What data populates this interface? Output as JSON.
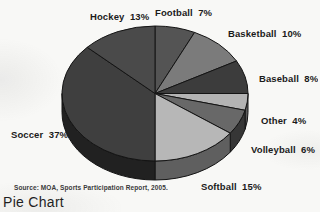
{
  "caption": "Pie Chart",
  "source_note": "Source: MOA, Sports Participation Report, 2005.",
  "chart_data": {
    "type": "pie",
    "style": "3d",
    "title": "Pie Chart",
    "unit": "%",
    "start_angle_deg": 0,
    "direction": "clockwise",
    "source": "MOA, Sports Participation Report, 2005",
    "slices": [
      {
        "label": "Football",
        "value": 7,
        "color": "#545454",
        "label_x": 155,
        "label_y": 7
      },
      {
        "label": "Basketball",
        "value": 10,
        "color": "#7b7b7b",
        "label_x": 228,
        "label_y": 28
      },
      {
        "label": "Baseball",
        "value": 8,
        "color": "#3c3c3c",
        "label_x": 259,
        "label_y": 73
      },
      {
        "label": "Other",
        "value": 4,
        "color": "#b3b3b3",
        "label_x": 261,
        "label_y": 115
      },
      {
        "label": "Volleyball",
        "value": 6,
        "color": "#686868",
        "label_x": 251,
        "label_y": 144
      },
      {
        "label": "Softball",
        "value": 15,
        "color": "#b7b7b7",
        "label_x": 201,
        "label_y": 181
      },
      {
        "label": "Soccer",
        "value": 37,
        "color": "#3f3f3f",
        "label_x": 11,
        "label_y": 129
      },
      {
        "label": "Hockey",
        "value": 13,
        "color": "#4a4a4a",
        "label_x": 90,
        "label_y": 11
      }
    ],
    "outline_color": "#141414",
    "background_color": "#f8f8f6"
  }
}
